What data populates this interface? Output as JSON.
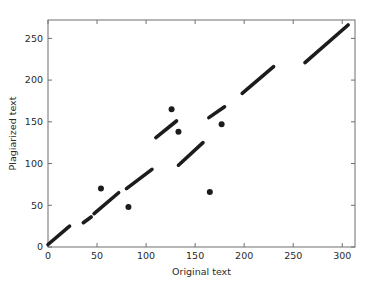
{
  "figure": {
    "background_color": "#ffffff",
    "axes_color": "#6f6f6f",
    "marker_color": "#1c1c1c"
  },
  "chart_data": {
    "type": "scatter",
    "title": "",
    "xlabel": "Original text",
    "ylabel": "Plagiarized text",
    "xlim": [
      0,
      313
    ],
    "ylim": [
      0,
      272
    ],
    "xticks": [
      0,
      50,
      100,
      150,
      200,
      250,
      300
    ],
    "yticks": [
      0,
      50,
      100,
      150,
      200,
      250
    ],
    "xtick_labels": [
      "0",
      "50",
      "100",
      "150",
      "200",
      "250",
      "300"
    ],
    "ytick_labels": [
      "0",
      "50",
      "100",
      "150",
      "200",
      "250"
    ],
    "grid": false,
    "legend": null,
    "marker": "dot",
    "marker_size": 3,
    "segments": [
      {
        "name": "run-1",
        "x0": 0,
        "y0": 3,
        "x1": 22,
        "y1": 25
      },
      {
        "name": "run-2",
        "x0": 36,
        "y0": 29,
        "x1": 44,
        "y1": 36
      },
      {
        "name": "run-3",
        "x0": 47,
        "y0": 40,
        "x1": 72,
        "y1": 65
      },
      {
        "name": "run-4",
        "x0": 80,
        "y0": 70,
        "x1": 106,
        "y1": 93
      },
      {
        "name": "run-5",
        "x0": 110,
        "y0": 131,
        "x1": 131,
        "y1": 151
      },
      {
        "name": "run-6",
        "x0": 133,
        "y0": 98,
        "x1": 158,
        "y1": 125
      },
      {
        "name": "run-7",
        "x0": 164,
        "y0": 155,
        "x1": 180,
        "y1": 168
      },
      {
        "name": "run-8",
        "x0": 198,
        "y0": 184,
        "x1": 230,
        "y1": 216
      },
      {
        "name": "run-9",
        "x0": 262,
        "y0": 221,
        "x1": 306,
        "y1": 266
      }
    ],
    "outliers": [
      {
        "name": "outlier-1",
        "x": 54,
        "y": 70
      },
      {
        "name": "outlier-2",
        "x": 82,
        "y": 48
      },
      {
        "name": "outlier-3",
        "x": 126,
        "y": 165
      },
      {
        "name": "outlier-4",
        "x": 133,
        "y": 138
      },
      {
        "name": "outlier-5",
        "x": 165,
        "y": 66
      },
      {
        "name": "outlier-6",
        "x": 177,
        "y": 147
      }
    ]
  }
}
